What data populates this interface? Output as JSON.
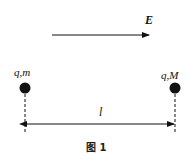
{
  "figure": {
    "field_label": "E",
    "left_charge_label": "q,m",
    "right_charge_label": "q,M",
    "distance_label": "l",
    "caption": "图 1",
    "colors": {
      "ink": "#111111",
      "background": "#ffffff"
    }
  }
}
